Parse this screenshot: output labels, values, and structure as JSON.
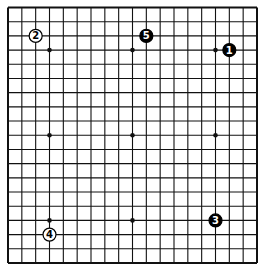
{
  "board": {
    "size": 19,
    "line_color": "#111111",
    "background": "#ffffff",
    "star_points": [
      [
        3,
        3
      ],
      [
        9,
        3
      ],
      [
        15,
        3
      ],
      [
        3,
        9
      ],
      [
        9,
        9
      ],
      [
        15,
        9
      ],
      [
        3,
        15
      ],
      [
        9,
        15
      ],
      [
        15,
        15
      ]
    ]
  },
  "stones": [
    {
      "move": "1",
      "color": "black",
      "col": 16,
      "row": 3
    },
    {
      "move": "2",
      "color": "white",
      "col": 2,
      "row": 2
    },
    {
      "move": "3",
      "color": "black",
      "col": 15,
      "row": 15
    },
    {
      "move": "4",
      "color": "white",
      "col": 3,
      "row": 16
    },
    {
      "move": "5",
      "color": "black",
      "col": 10,
      "row": 2
    }
  ]
}
